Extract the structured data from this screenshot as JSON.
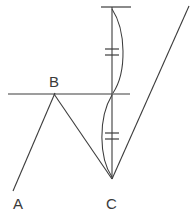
{
  "figure": {
    "kind": "geometry-diagram",
    "title": "",
    "background_color": "#ffffff",
    "stroke_color": "#3c3c3c",
    "width": 192,
    "height": 219,
    "labels": {
      "a": "A",
      "b": "B",
      "c": "C"
    },
    "points": {
      "A": {
        "x": 13,
        "y": 191
      },
      "B": {
        "x": 54,
        "y": 94
      },
      "C": {
        "x": 112,
        "y": 178
      },
      "top_of_vertical": {
        "x": 112,
        "y": 7
      },
      "top_right_end": {
        "x": 189,
        "y": 6
      },
      "horizontal_left_end": {
        "x": 8,
        "y": 94
      },
      "horizontal_right_end": {
        "x": 130,
        "y": 94
      },
      "top_tick_left": {
        "x": 101,
        "y": 7
      },
      "top_tick_right": {
        "x": 131,
        "y": 7
      }
    },
    "segments": [
      {
        "name": "ray-A-to-B",
        "from": "A",
        "to": "B"
      },
      {
        "name": "segment-B-to-C",
        "from": "B",
        "to": "C"
      },
      {
        "name": "ray-C-to-top-right",
        "from": "C",
        "to": "top_right_end"
      },
      {
        "name": "vertical-line-through-C",
        "from": "top_of_vertical",
        "to": "C"
      },
      {
        "name": "horizontal-line",
        "from": "horizontal_left_end",
        "to": "horizontal_right_end"
      },
      {
        "name": "top-tick-mark",
        "from": "top_tick_left",
        "to": "top_tick_right"
      }
    ],
    "arcs": [
      {
        "name": "upper-arc",
        "bulge": "right",
        "from_y": 9,
        "to_y": 93
      },
      {
        "name": "lower-arc",
        "bulge": "left",
        "from_y": 95,
        "to_y": 177
      }
    ],
    "congruence_marks": [
      {
        "name": "upper-double-tick",
        "position_y": 52,
        "count": 2
      },
      {
        "name": "lower-double-tick",
        "position_y": 136,
        "count": 2
      }
    ]
  }
}
